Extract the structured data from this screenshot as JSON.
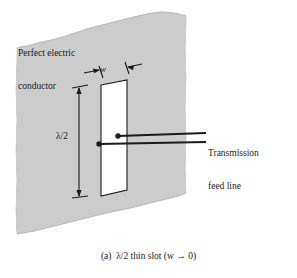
{
  "figure": {
    "caption": "(a)  λ/2 thin slot (w → 0)",
    "background_color": "#ffffff",
    "line_color": "#1a1a1a"
  },
  "conductor": {
    "label_line_1": "Perfect electric",
    "label_line_2": "conductor",
    "fill_color": "#cccccc",
    "stroke_color": "#b4b4b4"
  },
  "slot": {
    "fill_color": "#ffffff",
    "stroke_color": "#1a1a1a"
  },
  "dimensions": {
    "width_label": "w",
    "length_label": "λ/2"
  },
  "feed": {
    "label_line_1": "Transmission",
    "label_line_2": "feed line"
  }
}
